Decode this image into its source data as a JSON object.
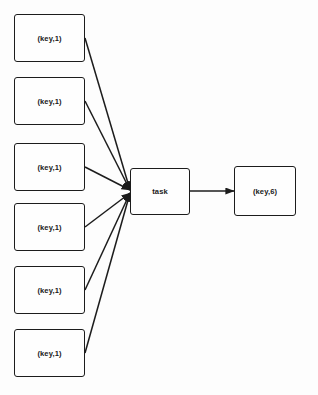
{
  "diagram": {
    "type": "dataflow-graph",
    "canvas": {
      "width": 318,
      "height": 395,
      "background": "#fdfdfd"
    },
    "style": {
      "node_fill": "#fefefe",
      "node_border": "#1c1c1c",
      "edge_color": "#1c1c1c",
      "text_color": "#1a1a1a"
    },
    "input_nodes": [
      {
        "id": "in1",
        "label": "(key,1)",
        "x": 14,
        "y": 14,
        "w": 71,
        "h": 48
      },
      {
        "id": "in2",
        "label": "(key,1)",
        "x": 14,
        "y": 77,
        "w": 71,
        "h": 48
      },
      {
        "id": "in3",
        "label": "(key,1)",
        "x": 14,
        "y": 143,
        "w": 71,
        "h": 48
      },
      {
        "id": "in4",
        "label": "(key,1)",
        "x": 14,
        "y": 203,
        "w": 71,
        "h": 48
      },
      {
        "id": "in5",
        "label": "(key,1)",
        "x": 14,
        "y": 266,
        "w": 71,
        "h": 48
      },
      {
        "id": "in6",
        "label": "(key,1)",
        "x": 14,
        "y": 329,
        "w": 71,
        "h": 48
      }
    ],
    "task_node": {
      "id": "task",
      "label": "task",
      "x": 130,
      "y": 168,
      "w": 60,
      "h": 47
    },
    "output_node": {
      "id": "out",
      "label": "(key,6)",
      "x": 234,
      "y": 166,
      "w": 62,
      "h": 50
    },
    "edges": [
      {
        "from": "in1",
        "to": "task",
        "x1": 85,
        "y1": 38,
        "x2": 130,
        "y2": 190
      },
      {
        "from": "in2",
        "to": "task",
        "x1": 85,
        "y1": 101,
        "x2": 130,
        "y2": 190
      },
      {
        "from": "in3",
        "to": "task",
        "x1": 85,
        "y1": 167,
        "x2": 130,
        "y2": 190
      },
      {
        "from": "in4",
        "to": "task",
        "x1": 85,
        "y1": 227,
        "x2": 130,
        "y2": 193
      },
      {
        "from": "in5",
        "to": "task",
        "x1": 85,
        "y1": 290,
        "x2": 130,
        "y2": 193
      },
      {
        "from": "in6",
        "to": "task",
        "x1": 85,
        "y1": 353,
        "x2": 130,
        "y2": 193
      },
      {
        "from": "task",
        "to": "out",
        "x1": 190,
        "y1": 191,
        "x2": 234,
        "y2": 191
      }
    ]
  }
}
